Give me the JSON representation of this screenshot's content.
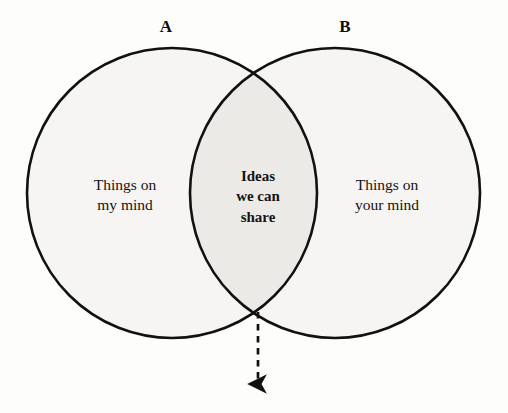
{
  "diagram": {
    "type": "venn-2-set",
    "background_color": "#fdfdfc",
    "stroke_color": "#111111",
    "set_fill_color": "#f6f5f3",
    "intersection_fill_color": "#eceae7",
    "labels": {
      "set_a": "A",
      "set_b": "B"
    },
    "regions": {
      "left_only": {
        "line1": "Things on",
        "line2": "my mind"
      },
      "intersection": {
        "line1": "Ideas",
        "line2": "we can",
        "line3": "share"
      },
      "right_only": {
        "line1": "Things on",
        "line2": "your mind"
      }
    },
    "annotation": {
      "arrow": "dashed-down-arrow",
      "from_x": 258,
      "from_y": 312,
      "to_x": 258,
      "to_y": 390
    },
    "geometry": {
      "left_circle": {
        "cx": 172,
        "cy": 193,
        "r": 145
      },
      "right_circle": {
        "cx": 335,
        "cy": 193,
        "r": 145
      },
      "stroke_width": 2.6
    }
  }
}
